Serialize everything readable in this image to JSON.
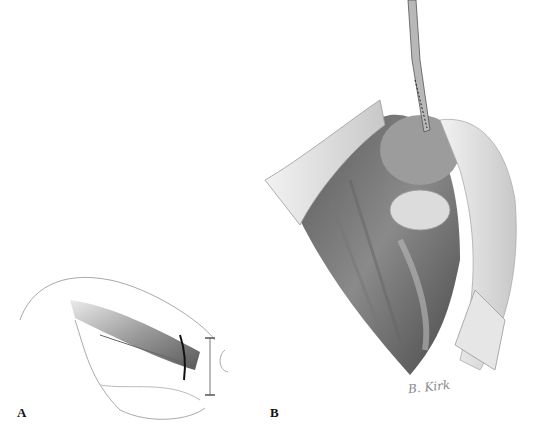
{
  "figure": {
    "panels": [
      {
        "id": "A",
        "label": "A",
        "description": "Line drawing of hip/thigh region with muscle bundle divided and incision marked"
      },
      {
        "id": "B",
        "label": "B",
        "description": "Shaded surgical exposure illustration with retractors and forceps instrument"
      }
    ],
    "signature": "B. Kirk",
    "colors": {
      "background": "#ffffff",
      "ink": "#111111",
      "shade_dark": "#4a4a4a",
      "shade_mid": "#9a9a9a",
      "shade_light": "#d6d6d6"
    }
  }
}
